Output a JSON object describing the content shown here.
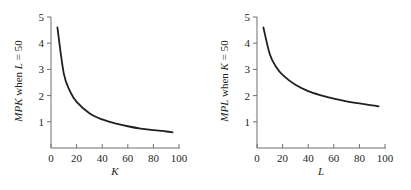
{
  "chart_data": [
    {
      "type": "line",
      "title": "",
      "xlabel": "K",
      "ylabel": "MPK when L = 50",
      "ylabel_parts": {
        "var": "MPK",
        "when": " when ",
        "hold_var": "L",
        "hold_val": " = 50"
      },
      "xlim": [
        0,
        100
      ],
      "ylim": [
        0,
        5
      ],
      "xticks": [
        0,
        20,
        40,
        60,
        80,
        100
      ],
      "yticks": [
        1,
        2,
        3,
        4,
        5
      ],
      "grid": false,
      "legend": null,
      "series": [
        {
          "name": "MPK",
          "x": [
            5,
            10,
            15,
            20,
            30,
            40,
            50,
            60,
            70,
            80,
            90,
            95
          ],
          "y": [
            4.6,
            2.84,
            2.15,
            1.76,
            1.33,
            1.09,
            0.94,
            0.83,
            0.74,
            0.68,
            0.63,
            0.6
          ]
        }
      ]
    },
    {
      "type": "line",
      "title": "",
      "xlabel": "L",
      "ylabel": "MPL when K = 50",
      "ylabel_parts": {
        "var": "MPL",
        "when": " when ",
        "hold_var": "K",
        "hold_val": " = 50"
      },
      "xlim": [
        0,
        100
      ],
      "ylim": [
        0,
        5
      ],
      "xticks": [
        0,
        20,
        40,
        60,
        80,
        100
      ],
      "yticks": [
        1,
        2,
        3,
        4,
        5
      ],
      "grid": false,
      "legend": null,
      "series": [
        {
          "name": "MPL",
          "x": [
            5,
            10,
            15,
            20,
            30,
            40,
            50,
            60,
            70,
            80,
            90,
            95
          ],
          "y": [
            4.6,
            3.58,
            3.09,
            2.79,
            2.41,
            2.17,
            2.01,
            1.88,
            1.78,
            1.7,
            1.63,
            1.59
          ]
        }
      ]
    }
  ],
  "colors": {
    "line": "#231f20",
    "axis": "#6d6e71",
    "text": "#231f20"
  }
}
